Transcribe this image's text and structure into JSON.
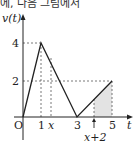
{
  "caption": "에, 다음 그림에서",
  "diagram": {
    "y_axis_label": "v(t)",
    "x_axis_label": "t",
    "origin_label": "O",
    "y_ticks": [
      "4",
      "2"
    ],
    "x_ticks": [
      "1",
      "x",
      "3",
      "x+2",
      "5"
    ],
    "points": [
      [
        0,
        0
      ],
      [
        1,
        4
      ],
      [
        3,
        0
      ],
      [
        5,
        2
      ]
    ],
    "shaded_region": {
      "from": "x+2",
      "to": "5"
    },
    "colors": {
      "line": "#222222",
      "shade": "#e3e3e3",
      "dash": "#555555"
    }
  }
}
